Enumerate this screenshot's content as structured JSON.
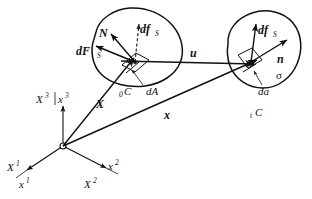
{
  "figure": {
    "background": "#ffffff",
    "ink": "#111111"
  },
  "configurations": {
    "reference": {
      "name": "reference-configuration",
      "label": "C",
      "label_prefix": "0",
      "area_element_label": "dA",
      "normal_label": "N",
      "force_label": "dF",
      "force_sub": "S",
      "mapped_force_label": "df",
      "mapped_force_sub": "S"
    },
    "current": {
      "name": "current-configuration",
      "label": "C",
      "label_prefix": "t",
      "area_element_label": "da",
      "normal_label": "n",
      "force_label": "df",
      "force_sub": "S",
      "stress_label": "σ"
    }
  },
  "vectors": {
    "position_reference": "X",
    "position_current": "x",
    "displacement": "u"
  },
  "axes": {
    "material": [
      {
        "label": "X",
        "sup": "1"
      },
      {
        "label": "X",
        "sup": "2"
      },
      {
        "label": "X",
        "sup": "3"
      }
    ],
    "spatial": [
      {
        "label": "x",
        "sup": "1"
      },
      {
        "label": "x",
        "sup": "2"
      },
      {
        "label": "x",
        "sup": "3"
      }
    ],
    "origin_label": ""
  },
  "icons": {
    "arrowhead": "arrowhead-icon",
    "origin": "origin-point-icon"
  }
}
